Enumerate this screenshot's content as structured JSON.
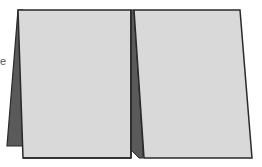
{
  "illustration": {
    "subject": "folded tent card",
    "text_fragment": "e",
    "colors": {
      "panel_fill": "#d9d9d9",
      "back_flap_fill": "#5a5a5a",
      "outline": "#2a2a2a",
      "background": "#ffffff"
    },
    "parts": [
      "left-back-flap",
      "left-front-panel",
      "center-fold",
      "right-front-panel"
    ]
  }
}
